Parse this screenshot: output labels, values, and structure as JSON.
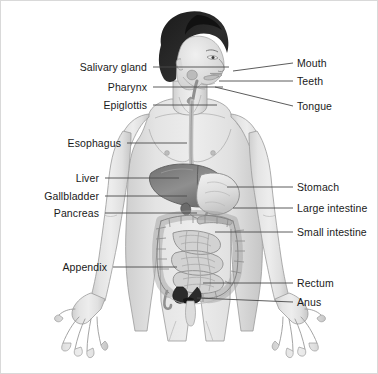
{
  "figure": {
    "background_color": "#ffffff",
    "border_color": "#d9d9d9",
    "leader_line_color": "#4a4a4a",
    "label_text_color": "#1a1a1a"
  },
  "labels": {
    "left": [
      {
        "id": "salivary-gland",
        "text": "Salivary gland",
        "text_x": 148,
        "text_y": 66,
        "line_x1": 152,
        "line_y1": 66,
        "line_x2": 228,
        "line_y2": 66,
        "tip_x": 228,
        "tip_y": 66
      },
      {
        "id": "pharynx",
        "text": "Pharynx",
        "text_x": 148,
        "text_y": 86,
        "line_x1": 152,
        "line_y1": 86,
        "line_x2": 222,
        "line_y2": 86,
        "tip_x": 222,
        "tip_y": 86
      },
      {
        "id": "epiglottis",
        "text": "Epiglottis",
        "text_x": 148,
        "text_y": 104,
        "line_x1": 152,
        "line_y1": 104,
        "line_x2": 216,
        "line_y2": 104,
        "tip_x": 216,
        "tip_y": 104
      },
      {
        "id": "esophagus",
        "text": "Esophagus",
        "text_x": 122,
        "text_y": 142,
        "line_x1": 126,
        "line_y1": 142,
        "line_x2": 186,
        "line_y2": 142,
        "tip_x": 186,
        "tip_y": 142
      },
      {
        "id": "liver",
        "text": "Liver",
        "text_x": 100,
        "text_y": 177,
        "line_x1": 104,
        "line_y1": 177,
        "line_x2": 178,
        "line_y2": 177,
        "tip_x": 178,
        "tip_y": 177
      },
      {
        "id": "gallbladder",
        "text": "Gallbladder",
        "text_x": 100,
        "text_y": 195,
        "line_x1": 104,
        "line_y1": 195,
        "line_x2": 186,
        "line_y2": 195,
        "tip_x": 186,
        "tip_y": 195
      },
      {
        "id": "pancreas",
        "text": "Pancreas",
        "text_x": 100,
        "text_y": 212,
        "line_x1": 104,
        "line_y1": 212,
        "line_x2": 196,
        "line_y2": 212,
        "tip_x": 196,
        "tip_y": 212
      },
      {
        "id": "appendix",
        "text": "Appendix",
        "text_x": 108,
        "text_y": 266,
        "line_x1": 112,
        "line_y1": 266,
        "line_x2": 176,
        "line_y2": 266,
        "tip_x": 176,
        "tip_y": 266
      }
    ],
    "right": [
      {
        "id": "mouth",
        "text": "Mouth",
        "text_x": 296,
        "text_y": 62,
        "line_x1": 292,
        "line_y1": 62,
        "line_x2": 232,
        "line_y2": 70,
        "tip_x": 232,
        "tip_y": 70
      },
      {
        "id": "teeth",
        "text": "Teeth",
        "text_x": 296,
        "text_y": 80,
        "line_x1": 292,
        "line_y1": 80,
        "line_x2": 218,
        "line_y2": 80,
        "tip_x": 218,
        "tip_y": 80
      },
      {
        "id": "tongue",
        "text": "Tongue",
        "text_x": 296,
        "text_y": 105,
        "line_x1": 292,
        "line_y1": 105,
        "line_x2": 214,
        "line_y2": 86,
        "tip_x": 214,
        "tip_y": 86
      },
      {
        "id": "stomach",
        "text": "Stomach",
        "text_x": 296,
        "text_y": 186,
        "line_x1": 292,
        "line_y1": 186,
        "line_x2": 226,
        "line_y2": 186,
        "tip_x": 226,
        "tip_y": 186
      },
      {
        "id": "large-intestine",
        "text": "Large intestine",
        "text_x": 296,
        "text_y": 207,
        "line_x1": 292,
        "line_y1": 207,
        "line_x2": 232,
        "line_y2": 207,
        "tip_x": 232,
        "tip_y": 207
      },
      {
        "id": "small-intestine",
        "text": "Small intestine",
        "text_x": 296,
        "text_y": 231,
        "line_x1": 292,
        "line_y1": 231,
        "line_x2": 214,
        "line_y2": 231,
        "tip_x": 214,
        "tip_y": 231
      },
      {
        "id": "rectum",
        "text": "Rectum",
        "text_x": 296,
        "text_y": 282,
        "line_x1": 292,
        "line_y1": 282,
        "line_x2": 202,
        "line_y2": 282,
        "tip_x": 202,
        "tip_y": 282
      },
      {
        "id": "anus",
        "text": "Anus",
        "text_x": 296,
        "text_y": 301,
        "line_x1": 292,
        "line_y1": 301,
        "line_x2": 196,
        "line_y2": 297,
        "tip_x": 196,
        "tip_y": 297
      }
    ]
  },
  "organs": [
    {
      "id": "liver",
      "name": "Liver",
      "color": "#8c8c8c"
    },
    {
      "id": "stomach",
      "name": "Stomach",
      "color": "#e3e3e3"
    },
    {
      "id": "gallbladder",
      "name": "Gallbladder",
      "color": "#6e6e6e"
    },
    {
      "id": "pancreas",
      "name": "Pancreas",
      "color": "#bdbdbd"
    },
    {
      "id": "large-intestine",
      "name": "Large intestine",
      "color": "#c9c9c9"
    },
    {
      "id": "small-intestine",
      "name": "Small intestine",
      "color": "#d4d4d4"
    },
    {
      "id": "esophagus",
      "name": "Esophagus",
      "color": "#d0d0d0"
    },
    {
      "id": "appendix",
      "name": "Appendix",
      "color": "#b5b5b5"
    },
    {
      "id": "rectum",
      "name": "Rectum",
      "color": "#2b2b2b"
    },
    {
      "id": "anus",
      "name": "Anus",
      "color": "#1f1f1f"
    }
  ],
  "body": {
    "skin_color": "#dcdcdc",
    "skin_shadow": "#c2c2c2",
    "outline_color": "#8a8a8a",
    "hair_color": "#242424"
  }
}
